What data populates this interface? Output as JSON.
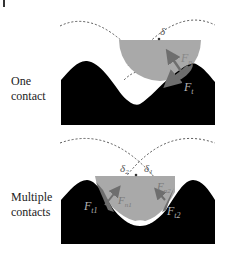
{
  "figure": {
    "type": "contact-mechanics-diagram",
    "colors": {
      "terrain": "#000000",
      "particle": "#a9a9a9",
      "force_arrow": "#6e6e6e",
      "dotted_arc": "#555555",
      "label_on_dark": "#b5b5b5"
    }
  },
  "panels": [
    {
      "label_line1": "One",
      "label_line2": "contact",
      "angle_label": "δ",
      "forces": {
        "normal": {
          "symbol": "F",
          "subscript": "n"
        },
        "tangential": {
          "symbol": "F",
          "subscript": "t"
        }
      }
    },
    {
      "label_line1": "Multiple",
      "label_line2": "contacts",
      "angle_labels": [
        {
          "symbol": "δ",
          "subscript": "2"
        },
        {
          "symbol": "δ",
          "subscript": "1"
        }
      ],
      "forces": {
        "normal_1": {
          "symbol": "F",
          "subscript": "n1"
        },
        "normal_2": {
          "symbol": "F",
          "subscript": "n2"
        },
        "tangential_1": {
          "symbol": "F",
          "subscript": "t1"
        },
        "tangential_2": {
          "symbol": "F",
          "subscript": "t2"
        }
      }
    }
  ]
}
